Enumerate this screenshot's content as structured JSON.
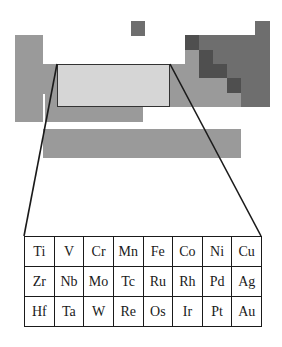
{
  "diagram": {
    "colors": {
      "metal_grey": "#9a9a9a",
      "nonmetal_grey": "#6e6e6e",
      "metalloid_dark": "#4f4f4f",
      "highlight_fill": "#d6d6d6",
      "line_color": "#1a1a1a"
    },
    "highlight_region": {
      "label": "transition metals groups 4-11",
      "x": 57,
      "y": 64,
      "width": 113,
      "height": 43
    }
  },
  "element_table": {
    "rows": [
      [
        "Ti",
        "V",
        "Cr",
        "Mn",
        "Fe",
        "Co",
        "Ni",
        "Cu"
      ],
      [
        "Zr",
        "Nb",
        "Mo",
        "Tc",
        "Ru",
        "Rh",
        "Pd",
        "Ag"
      ],
      [
        "Hf",
        "Ta",
        "W",
        "Re",
        "Os",
        "Ir",
        "Pt",
        "Au"
      ]
    ]
  }
}
